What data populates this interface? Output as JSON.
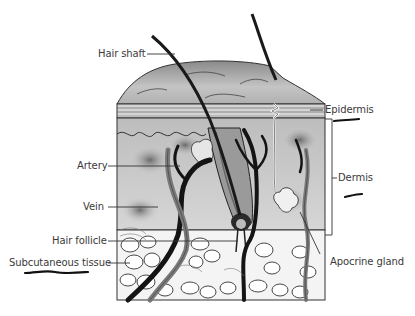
{
  "diagram": {
    "labels": {
      "hair_shaft": "Hair shaft",
      "epidermis": "Epidermis",
      "dermis": "Dermis",
      "artery": "Artery",
      "vein": "Vein",
      "hair_follicle": "Hair follicle",
      "subcutaneous_tissue": "Subcutaneous tissue",
      "apocrine_gland": "Apocrine gland"
    },
    "handwritten_underlines": [
      "Epidermis",
      "Dermis",
      "Subcutaneous tissue"
    ],
    "colors": {
      "ink": "#1a1a1a",
      "label_text": "#3a3a3a",
      "tissue_light": "#e6e6e6",
      "tissue_mid": "#a8a8a8",
      "tissue_dark": "#5a5a5a",
      "background": "#ffffff"
    }
  }
}
